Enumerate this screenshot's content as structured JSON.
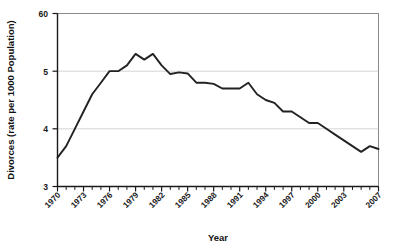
{
  "chart_data": {
    "type": "line",
    "title": "",
    "xlabel": "Year",
    "ylabel": "Divorces (rate per 1000 Population)",
    "xlim": [
      1970,
      2007
    ],
    "ylim": [
      3,
      6
    ],
    "ytick_labels": [
      "3",
      "4",
      "5",
      "60"
    ],
    "ytick_values": [
      3,
      4,
      5,
      6
    ],
    "xtick_labels": [
      "1970",
      "1973",
      "1976",
      "1979",
      "1982",
      "1985",
      "1988",
      "1991",
      "1994",
      "1997",
      "2000",
      "2003",
      "2007"
    ],
    "xtick_values": [
      1970,
      1973,
      1976,
      1979,
      1982,
      1985,
      1988,
      1991,
      1994,
      1997,
      2000,
      2003,
      2007
    ],
    "grid": "horizontal",
    "legend": "none",
    "series": [
      {
        "name": "Divorce rate",
        "color": "#222222",
        "x": [
          1970,
          1971,
          1972,
          1973,
          1974,
          1975,
          1976,
          1977,
          1978,
          1979,
          1980,
          1981,
          1982,
          1983,
          1984,
          1985,
          1986,
          1987,
          1988,
          1989,
          1990,
          1991,
          1992,
          1993,
          1994,
          1995,
          1996,
          1997,
          1998,
          1999,
          2000,
          2001,
          2002,
          2003,
          2004,
          2005,
          2006,
          2007
        ],
        "values": [
          3.5,
          3.7,
          4.0,
          4.3,
          4.6,
          4.8,
          5.0,
          5.0,
          5.1,
          5.3,
          5.2,
          5.3,
          5.1,
          4.95,
          4.98,
          4.96,
          4.8,
          4.8,
          4.78,
          4.7,
          4.7,
          4.7,
          4.8,
          4.6,
          4.5,
          4.45,
          4.3,
          4.3,
          4.2,
          4.1,
          4.1,
          4.0,
          3.9,
          3.8,
          3.7,
          3.6,
          3.7,
          3.65
        ]
      }
    ]
  },
  "axes": {
    "ylabel": "Divorces (rate per 1000 Population)",
    "xlabel": "Year"
  }
}
